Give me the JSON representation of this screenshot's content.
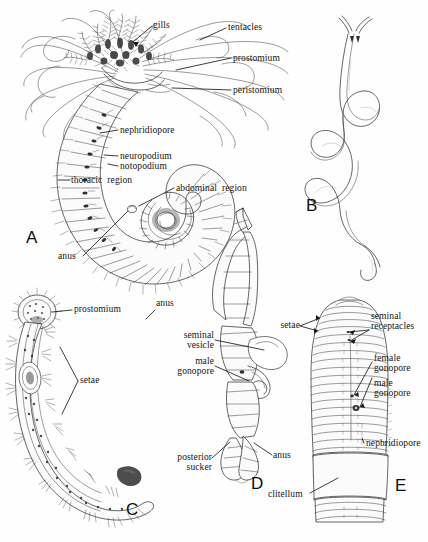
{
  "figure": {
    "panel_count": 5,
    "caption": ""
  },
  "panels": [
    {
      "id": "A",
      "letter": "A",
      "subject": "polychaete-worm-whole-body",
      "labels": [
        "gills",
        "tentacles",
        "prostomium",
        "peristomium",
        "nephridiopore",
        "neuropodium",
        "notopodium",
        "thoracic region",
        "abdominal region",
        "anus"
      ]
    },
    {
      "id": "B",
      "letter": "B",
      "subject": "coiled-unsegmented-worm",
      "labels": []
    },
    {
      "id": "C",
      "letter": "C",
      "subject": "leech-ventral-view-with-setae",
      "labels": [
        "prostomium",
        "setae",
        "anus"
      ]
    },
    {
      "id": "D",
      "letter": "D",
      "subject": "leech-lateral-view-reproductive",
      "labels": [
        "seminal vesicle",
        "male gonopore",
        "posterior sucker",
        "anus"
      ]
    },
    {
      "id": "E",
      "letter": "E",
      "subject": "earthworm-anterior-segments",
      "labels": [
        "setae",
        "seminal receptacles",
        "female gonopore",
        "male gonopore",
        "nephridiopore",
        "clitellum"
      ]
    }
  ],
  "labels": {
    "gills": "gills",
    "tentacles": "tentacles",
    "prostomium": "prostomium",
    "peristomium": "peristomium",
    "nephridiopore": "nephridiopore",
    "neuropodium": "neuropodium",
    "notopodium": "notopodium",
    "thoracic_region": "thoracic  region",
    "abdominal_region": "abdominal  region",
    "anus": "anus",
    "prostomium_c": "prostomium",
    "setae_c": "setae",
    "anus_c": "anus",
    "seminal_vesicle": "seminal\nvesicle",
    "male_gonopore_d": "male\ngonopore",
    "posterior_sucker": "posterior\nsucker",
    "anus_d": "anus",
    "setae_e": "setae",
    "seminal_receptacles": "seminal\nreceptacles",
    "female_gonopore": "female\ngonopore",
    "male_gonopore_e": "male\ngonopore",
    "nephridiopore_e": "nephridiopore",
    "clitellum": "clitellum"
  },
  "letters": {
    "a": "A",
    "b": "B",
    "c": "C",
    "d": "D",
    "e": "E"
  },
  "colors": {
    "background": "#ffffff",
    "ink": "#2b2b2b",
    "ink_dark": "#1e1e1e",
    "text": "#141414",
    "shading_dark": "#2e2e2e",
    "shading_mid": "#6d6d6d",
    "shading_light": "#b8b8b8"
  }
}
